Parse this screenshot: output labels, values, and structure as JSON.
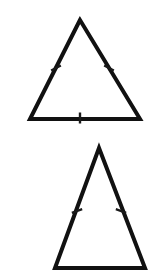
{
  "image": {
    "title": "Two isosceles triangles with congruence tick marks",
    "width": 152,
    "height": 276,
    "background_color": "#ffffff",
    "stroke_color": "#111111",
    "tick_color": "#1a1a1a",
    "alt_text": "Top triangle with tick marks on all three sides; bottom triangle with tick marks on its two slanted sides only."
  },
  "chart_data": {
    "type": "scatter",
    "xlabel": "",
    "ylabel": "",
    "xlim": [
      0,
      152
    ],
    "ylim": [
      276,
      0
    ],
    "grid": false,
    "legend": "none",
    "figures": [
      {
        "name": "triangle-top",
        "label": "Top triangle",
        "vertices": [
          {
            "name": "apex",
            "x": 80,
            "y": 20
          },
          {
            "name": "bottom-left",
            "x": 30,
            "y": 119
          },
          {
            "name": "bottom-right",
            "x": 140,
            "y": 119
          }
        ],
        "stroke_width": 4,
        "tick_marks": [
          {
            "side": "left-leg",
            "count": 1,
            "x": 56,
            "y": 68,
            "angle": -27
          },
          {
            "side": "right-leg",
            "count": 1,
            "x": 109,
            "y": 68,
            "angle": 27
          },
          {
            "side": "base",
            "count": 1,
            "x": 80,
            "y": 118,
            "angle": 90
          }
        ]
      },
      {
        "name": "triangle-bottom",
        "label": "Bottom triangle",
        "vertices": [
          {
            "name": "apex",
            "x": 99,
            "y": 148
          },
          {
            "name": "bottom-left",
            "x": 55,
            "y": 268
          },
          {
            "name": "bottom-right",
            "x": 145,
            "y": 268
          }
        ],
        "stroke_width": 4,
        "tick_marks": [
          {
            "side": "left-leg",
            "count": 1,
            "x": 77,
            "y": 211,
            "angle": -20
          },
          {
            "side": "right-leg",
            "count": 1,
            "x": 121,
            "y": 211,
            "angle": 20
          }
        ]
      }
    ]
  }
}
